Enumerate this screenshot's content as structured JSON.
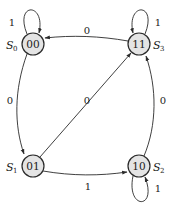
{
  "diagram": {
    "type": "finite-state-machine",
    "states": [
      {
        "id": "S0",
        "name": "S",
        "sub": "0",
        "code": "00"
      },
      {
        "id": "S1",
        "name": "S",
        "sub": "1",
        "code": "01"
      },
      {
        "id": "S2",
        "name": "S",
        "sub": "2",
        "code": "10"
      },
      {
        "id": "S3",
        "name": "S",
        "sub": "3",
        "code": "11"
      }
    ],
    "transitions": [
      {
        "from": "S0",
        "to": "S0",
        "label": "1"
      },
      {
        "from": "S0",
        "to": "S1",
        "label": "0"
      },
      {
        "from": "S1",
        "to": "S3",
        "label": "0"
      },
      {
        "from": "S1",
        "to": "S2",
        "label": "1"
      },
      {
        "from": "S2",
        "to": "S2",
        "label": "1"
      },
      {
        "from": "S2",
        "to": "S3",
        "label": "0"
      },
      {
        "from": "S3",
        "to": "S3",
        "label": "1"
      },
      {
        "from": "S3",
        "to": "S0",
        "label": "0"
      }
    ]
  },
  "colors": {
    "node_fill": "#e4e4e4",
    "stroke": "#2a2a2a"
  }
}
